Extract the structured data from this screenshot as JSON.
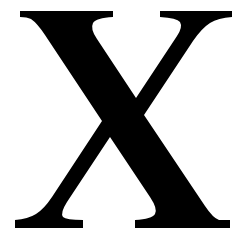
{
  "image": {
    "kind": "letterform-artwork",
    "description": "Large uppercase serif letter X, black on white",
    "width": 243,
    "height": 240,
    "background_color": "#ffffff"
  },
  "glyph": {
    "character": "X",
    "name": "letter-x",
    "case": "uppercase",
    "style": "serif",
    "typeface_style": "transitional-serif-bracketed",
    "fill_color": "#000000",
    "alt_text": "X",
    "stroke_weights": {
      "thick_diagonal": "heavy",
      "thin_diagonal": "light"
    },
    "geometry": {
      "center_crossing_x": 120,
      "center_crossing_y": 118,
      "cap_top_y": 11,
      "baseline_y": 228,
      "serif_bar_thickness": 6,
      "top_left_serif": {
        "x_start": 20,
        "x_end": 113,
        "y_top": 11,
        "y_bottom": 17
      },
      "top_right_serif": {
        "x_start": 153,
        "x_end": 232,
        "y_top": 11,
        "y_bottom": 17
      },
      "bottom_left_serif": {
        "x_start": 15,
        "x_end": 90,
        "y_top": 220,
        "y_bottom": 228
      },
      "bottom_right_serif": {
        "x_start": 135,
        "x_end": 230,
        "y_top": 220,
        "y_bottom": 228
      }
    }
  }
}
